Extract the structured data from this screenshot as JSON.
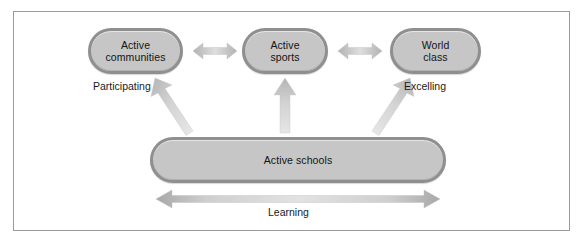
{
  "diagram": {
    "background_color": "#ffffff",
    "frame_color": "#9a9a9a",
    "node_fill_color": "#c6c6c6",
    "node_border_color": "#8f8f8f",
    "arrow_color": "#c9c9c9",
    "text_color": "#141414",
    "nodes": [
      {
        "id": "communities",
        "label": "Active\ncommunities",
        "line1": "Active",
        "line2": "communities"
      },
      {
        "id": "sports",
        "label": "Active\nsports",
        "line1": "Active",
        "line2": "sports"
      },
      {
        "id": "world",
        "label": "World\nclass",
        "line1": "World",
        "line2": "class"
      },
      {
        "id": "schools",
        "label": "Active schools",
        "line1": "Active schools",
        "line2": ""
      }
    ],
    "captions": [
      {
        "id": "participating",
        "text": "Participating",
        "under": "communities"
      },
      {
        "id": "excelling",
        "text": "Excelling",
        "under": "world"
      },
      {
        "id": "learning",
        "text": "Learning",
        "under": "bottom-arrow"
      }
    ],
    "connectors": [
      {
        "id": "communities-sports",
        "type": "double-arrow",
        "orientation": "horizontal",
        "from": "communities",
        "to": "sports"
      },
      {
        "id": "sports-world",
        "type": "double-arrow",
        "orientation": "horizontal",
        "from": "sports",
        "to": "world"
      },
      {
        "id": "schools-communities",
        "type": "arrow",
        "orientation": "diagonal-up-left",
        "from": "schools",
        "to": "communities"
      },
      {
        "id": "schools-sports",
        "type": "arrow",
        "orientation": "vertical-up",
        "from": "schools",
        "to": "sports"
      },
      {
        "id": "schools-world",
        "type": "arrow",
        "orientation": "diagonal-up-right",
        "from": "schools",
        "to": "world"
      },
      {
        "id": "learning-span",
        "type": "double-arrow",
        "orientation": "horizontal",
        "from": "schools-left",
        "to": "schools-right"
      }
    ]
  }
}
